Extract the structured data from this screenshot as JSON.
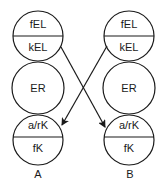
{
  "diagram": {
    "columns": [
      {
        "label": "A",
        "top_circle": {
          "upper": "fEL",
          "lower": "kEL"
        },
        "middle_circle": {
          "label": "ER"
        },
        "bottom_circle": {
          "upper": "a/rK",
          "lower": "fK"
        }
      },
      {
        "label": "B",
        "top_circle": {
          "upper": "fEL",
          "lower": "kEL"
        },
        "middle_circle": {
          "label": "ER"
        },
        "bottom_circle": {
          "upper": "a/rK",
          "lower": "fK"
        }
      }
    ],
    "arrows": [
      {
        "from": "A.kEL",
        "to": "B.a/rK"
      },
      {
        "from": "B.kEL",
        "to": "A.a/rK"
      }
    ],
    "colors": {
      "stroke": "#1a1a1a",
      "background": "#ffffff"
    }
  }
}
